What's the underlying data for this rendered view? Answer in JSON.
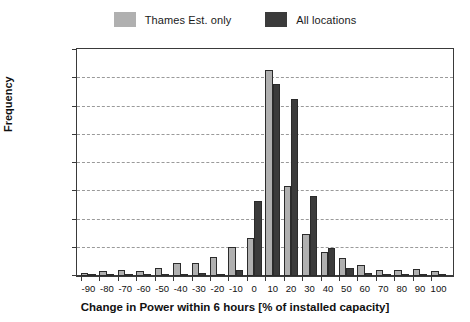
{
  "legend": {
    "items": [
      {
        "label": "Thames Est. only",
        "color": "#b0b0b0",
        "icon": "legend-swatch-light"
      },
      {
        "label": "All locations",
        "color": "#3b3b3b",
        "icon": "legend-swatch-dark"
      }
    ]
  },
  "chart_data": {
    "type": "bar",
    "title": "",
    "xlabel": "Change in Power within 6 hours [% of installed capacity]",
    "ylabel": "Frequency",
    "xlim": [
      -100,
      105
    ],
    "ylim": [
      0,
      40
    ],
    "grid": true,
    "legend_position": "top-center",
    "ytick_labels": [
      "0.0%",
      "5.0%",
      "10.0%",
      "15.0%",
      "20.0%",
      "25.0%",
      "30.0%",
      "35.0%",
      "40.0%"
    ],
    "ytick_values": [
      0,
      5,
      10,
      15,
      20,
      25,
      30,
      35,
      40
    ],
    "xtick_labels": [
      "-90",
      "-80",
      "-70",
      "-60",
      "-50",
      "-40",
      "-30",
      "-20",
      "-10",
      "0",
      "10",
      "20",
      "30",
      "40",
      "50",
      "60",
      "70",
      "80",
      "90",
      "100"
    ],
    "categories": [
      -90,
      -80,
      -70,
      -60,
      -50,
      -40,
      -30,
      -20,
      -10,
      0,
      10,
      20,
      30,
      40,
      50,
      60,
      70,
      80,
      90,
      100
    ],
    "series": [
      {
        "name": "Thames Est. only",
        "color": "#b0b0b0",
        "values": [
          0.6,
          0.9,
          1.0,
          0.9,
          1.4,
          2.3,
          2.3,
          3.3,
          5.1,
          6.8,
          36.4,
          16.0,
          7.4,
          4.2,
          3.2,
          1.9,
          1.1,
          1.0,
          1.2,
          0.8
        ]
      },
      {
        "name": "All locations",
        "color": "#3b3b3b",
        "values": [
          0.1,
          0.1,
          0.1,
          0.1,
          0.2,
          0.3,
          0.6,
          0.2,
          1.1,
          13.2,
          33.9,
          31.4,
          14.1,
          4.9,
          1.4,
          0.6,
          0.3,
          0.2,
          0.2,
          0.1
        ]
      }
    ]
  }
}
